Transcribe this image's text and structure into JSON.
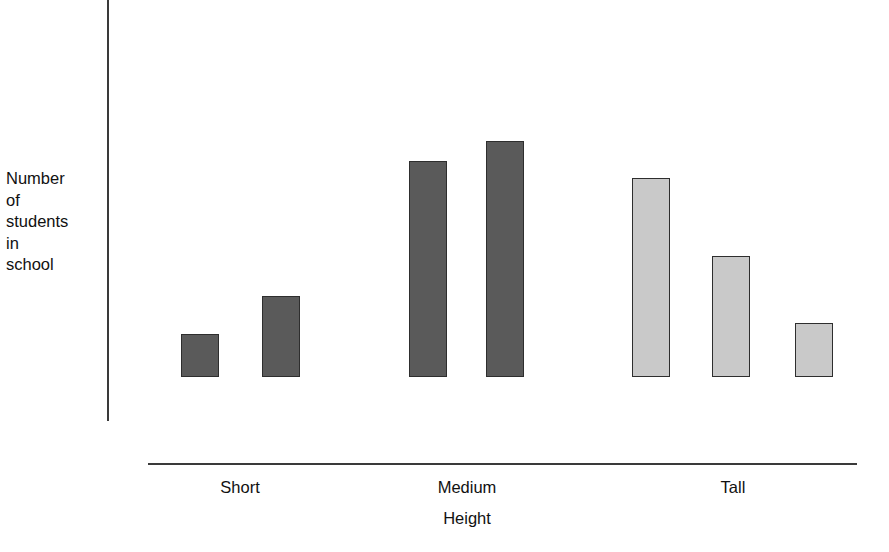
{
  "chart_data": {
    "type": "bar",
    "title": "",
    "subtitle": "",
    "xlabel": "Height",
    "ylabel": "Number\nof\nstudents\nin\nschool",
    "categories": [
      "Short",
      "Medium",
      "Tall"
    ],
    "grid": false,
    "legend": null,
    "axis": {
      "y_ticks": [],
      "x_ticks": [
        "Short",
        "Medium",
        "Tall"
      ],
      "ylim": [
        0,
        100
      ],
      "y_tick_labels_shown": false
    },
    "series": [
      {
        "name": "Number of students in school",
        "bars": [
          {
            "group": "Short",
            "index": 1,
            "value": 18,
            "color": "#5a5a5a",
            "shade": "dark"
          },
          {
            "group": "Short",
            "index": 2,
            "value": 34,
            "color": "#5a5a5a",
            "shade": "dark"
          },
          {
            "group": "Medium",
            "index": 3,
            "value": 91,
            "color": "#5a5a5a",
            "shade": "dark"
          },
          {
            "group": "Medium",
            "index": 4,
            "value": 100,
            "color": "#5a5a5a",
            "shade": "dark"
          },
          {
            "group": "Tall",
            "index": 5,
            "value": 84,
            "color": "#c9c9c9",
            "shade": "light"
          },
          {
            "group": "Tall",
            "index": 6,
            "value": 51,
            "color": "#c9c9c9",
            "shade": "light"
          },
          {
            "group": "Tall",
            "index": 7,
            "value": 23,
            "color": "#c9c9c9",
            "shade": "light"
          }
        ]
      }
    ],
    "colors": {
      "dark_bar": "#5a5a5a",
      "light_bar": "#c9c9c9",
      "bar_border": "#2e2e2e",
      "axis": "#3a3a3a",
      "text": "#111111",
      "background": "#ffffff"
    },
    "geometry": {
      "baseline_y": 464,
      "bars_px": [
        {
          "left": 181,
          "width": 38,
          "top": 421
        },
        {
          "left": 262,
          "width": 38,
          "top": 383
        },
        {
          "left": 409,
          "width": 38,
          "top": 248
        },
        {
          "left": 486,
          "width": 38,
          "top": 228
        },
        {
          "left": 632,
          "width": 38,
          "top": 265
        },
        {
          "left": 712,
          "width": 38,
          "top": 343
        },
        {
          "left": 795,
          "width": 38,
          "top": 410
        }
      ],
      "category_label_x": [
        240,
        467,
        733
      ]
    }
  }
}
